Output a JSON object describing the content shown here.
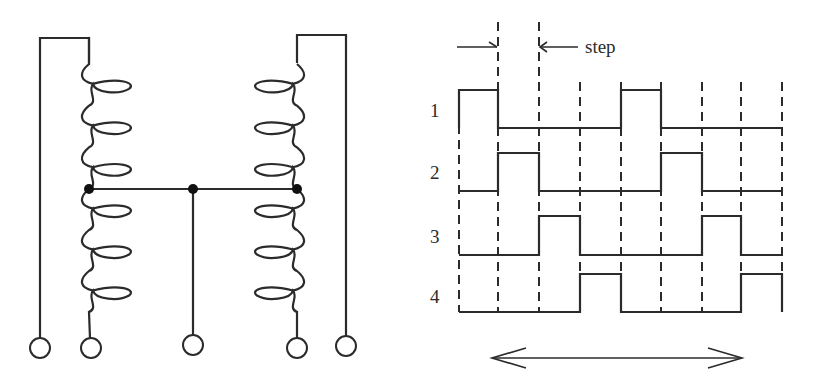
{
  "figure": {
    "left_panel": {
      "title": "",
      "description": "Bipolar-center-tapped (unipolar) stepper motor winding schematic: two center-tapped coils sharing a common tap",
      "coils": [
        {
          "name": "left-coil",
          "axis_x": 89,
          "upper_loops": 3,
          "lower_loops": 3,
          "loop_side": "right"
        },
        {
          "name": "right-coil",
          "axis_x": 297,
          "upper_loops": 3,
          "lower_loops": 3,
          "loop_side": "left"
        }
      ],
      "junctions": [
        {
          "name": "left-tap",
          "x": 89,
          "y": 189
        },
        {
          "name": "common-tap",
          "x": 193,
          "y": 189
        },
        {
          "name": "right-tap",
          "x": 297,
          "y": 189
        }
      ],
      "terminals": [
        {
          "name": "terminal-1",
          "x": 40,
          "y": 348
        },
        {
          "name": "terminal-2",
          "x": 91,
          "y": 348
        },
        {
          "name": "terminal-common",
          "x": 193,
          "y": 345
        },
        {
          "name": "terminal-3",
          "x": 297,
          "y": 348
        },
        {
          "name": "terminal-4",
          "x": 346,
          "y": 346
        }
      ]
    },
    "right_panel": {
      "annotation": {
        "step_label": "step"
      },
      "phase_labels": [
        "1",
        "2",
        "3",
        "4"
      ],
      "time_marks_x": [
        459,
        498,
        539,
        580,
        621,
        661,
        702,
        741,
        782
      ],
      "phases": [
        {
          "label": "1",
          "high_y": 90,
          "low_y": 128,
          "pulses": [
            [
              0,
              1
            ],
            [
              4,
              5
            ]
          ]
        },
        {
          "label": "2",
          "high_y": 153,
          "low_y": 191,
          "pulses": [
            [
              1,
              2
            ],
            [
              5,
              6
            ]
          ]
        },
        {
          "label": "3",
          "high_y": 216,
          "low_y": 255,
          "pulses": [
            [
              2,
              3
            ],
            [
              6,
              7
            ]
          ]
        },
        {
          "label": "4",
          "high_y": 274,
          "low_y": 312,
          "pulses": [
            [
              3,
              4
            ],
            [
              7,
              8
            ]
          ]
        }
      ],
      "period_arrow": {
        "x1": 490,
        "x2": 743,
        "y": 358
      }
    }
  },
  "colors": {
    "ink": "#2b2b2b",
    "dot": "#111111",
    "background": "#ffffff"
  }
}
